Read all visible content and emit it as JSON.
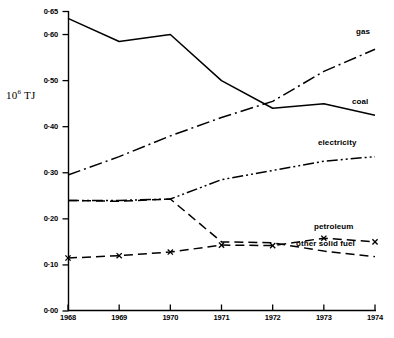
{
  "chart_data": {
    "type": "line",
    "title": "",
    "xlabel": "",
    "ylabel": "10^6 TJ",
    "ylabel_mantissa": "10",
    "ylabel_exponent": "6",
    "ylabel_unit": "TJ",
    "x": [
      1968,
      1969,
      1970,
      1971,
      1972,
      1973,
      1974
    ],
    "xtick_labels": [
      "1968",
      "1969",
      "1970",
      "1971",
      "1972",
      "1973",
      "1974"
    ],
    "ytick_values": [
      0.0,
      0.1,
      0.2,
      0.3,
      0.4,
      0.5,
      0.6,
      0.65
    ],
    "ytick_labels": [
      "0·00",
      "0·10",
      "0·20",
      "0·30",
      "0·40",
      "0·50",
      "0·60",
      "0·65"
    ],
    "xlim": [
      1968,
      1974
    ],
    "ylim": [
      0.0,
      0.65
    ],
    "grid": false,
    "legend_position": "inline-right-of-line-end",
    "series": [
      {
        "name": "coal",
        "label": "coal",
        "linestyle": "solid",
        "marker": "none",
        "color": "#000000",
        "values": [
          0.635,
          0.585,
          0.6,
          0.5,
          0.44,
          0.45,
          0.425
        ]
      },
      {
        "name": "gas",
        "label": "gas",
        "linestyle": "dash-dot",
        "marker": "none",
        "color": "#000000",
        "values": [
          0.295,
          0.335,
          0.38,
          0.42,
          0.455,
          0.52,
          0.568
        ]
      },
      {
        "name": "electricity",
        "label": "electricity",
        "linestyle": "dash-dot-dot",
        "marker": "none",
        "color": "#000000",
        "values": [
          0.24,
          0.24,
          0.243,
          0.285,
          0.305,
          0.325,
          0.335
        ]
      },
      {
        "name": "petroleum",
        "label": "petroleum",
        "linestyle": "dash",
        "marker": "x",
        "color": "#000000",
        "values": [
          0.115,
          0.12,
          0.128,
          0.143,
          0.142,
          0.158,
          0.15
        ]
      },
      {
        "name": "other-solid-fuel",
        "label": "other solid fuel",
        "linestyle": "dashed",
        "marker": "none",
        "color": "#000000",
        "values": [
          0.24,
          0.238,
          0.243,
          0.15,
          0.148,
          0.13,
          0.118
        ]
      }
    ]
  }
}
